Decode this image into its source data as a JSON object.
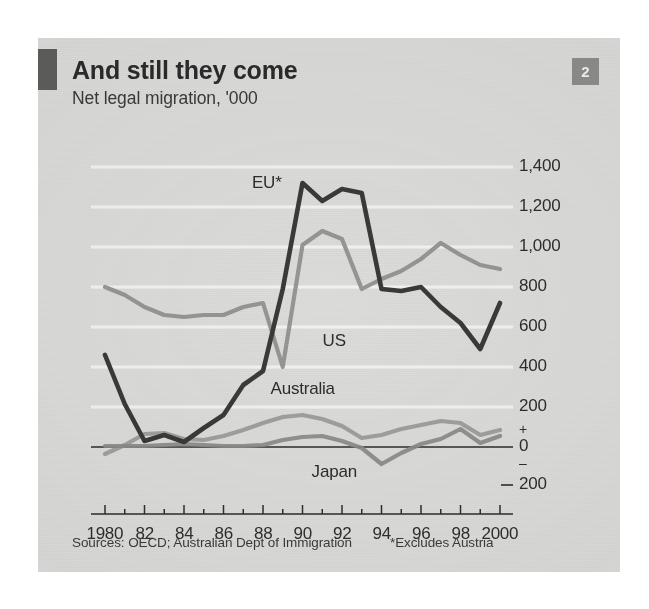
{
  "card": {
    "number_badge": "2",
    "title": "And still they come",
    "subtitle": "Net legal migration, '000",
    "source_note": "Sources: OECD; Australian Dept of Immigration",
    "footnote": "*Excludes Austria",
    "background_color": "#dcdcda",
    "rule_color": "#5e5e5c",
    "badge_color": "#8d8d8b"
  },
  "chart_data": {
    "type": "line",
    "title": "And still they come",
    "subtitle": "Net legal migration, '000",
    "xlabel": "",
    "ylabel": "Net legal migration, '000",
    "ylim": [
      -200,
      1500
    ],
    "xlim": [
      1980,
      2000
    ],
    "grid": true,
    "gridline_color": "#f4f4f2",
    "legend": "inline-labels",
    "y_ticks": [
      1400,
      1200,
      1000,
      800,
      600,
      400,
      200,
      0,
      -200
    ],
    "y_tick_labels": [
      "1,400",
      "1,200",
      "1,000",
      "800",
      "600",
      "400",
      "200",
      "0",
      "200"
    ],
    "y_sign_plus": "+",
    "y_sign_minus": "–",
    "x": [
      1980,
      1981,
      1982,
      1983,
      1984,
      1985,
      1986,
      1987,
      1988,
      1989,
      1990,
      1991,
      1992,
      1993,
      1994,
      1995,
      1996,
      1997,
      1998,
      1999,
      2000
    ],
    "x_tick_labels": [
      "1980",
      "82",
      "84",
      "86",
      "88",
      "90",
      "92",
      "94",
      "96",
      "98",
      "2000"
    ],
    "series": [
      {
        "name": "EU*",
        "label": "EU*",
        "color": "#3a3a38",
        "values": [
          460,
          215,
          30,
          60,
          25,
          95,
          160,
          310,
          380,
          790,
          1320,
          1230,
          1290,
          1270,
          790,
          780,
          800,
          700,
          620,
          490,
          720
        ]
      },
      {
        "name": "US",
        "label": "US",
        "color": "#8f8f8d",
        "values": [
          800,
          760,
          700,
          660,
          650,
          660,
          660,
          700,
          720,
          400,
          1010,
          1080,
          1040,
          790,
          840,
          880,
          940,
          1020,
          960,
          910,
          890
        ]
      },
      {
        "name": "Australia",
        "label": "Australia",
        "color": "#9a9a98",
        "values": [
          -35,
          10,
          65,
          70,
          40,
          35,
          55,
          85,
          120,
          150,
          160,
          140,
          105,
          45,
          60,
          90,
          110,
          130,
          120,
          60,
          85
        ]
      },
      {
        "name": "Japan",
        "label": "Japan",
        "color": "#8a8a88",
        "values": [
          5,
          5,
          5,
          10,
          15,
          10,
          5,
          5,
          10,
          35,
          50,
          55,
          30,
          -5,
          -85,
          -30,
          15,
          40,
          90,
          20,
          55
        ]
      }
    ],
    "annotations": [
      {
        "text": "EU*",
        "x": 1988.2,
        "y": 1320
      },
      {
        "text": "US",
        "x": 1991.6,
        "y": 530
      },
      {
        "text": "Australia",
        "x": 1990.0,
        "y": 290
      },
      {
        "text": "Japan",
        "x": 1991.6,
        "y": -125
      }
    ]
  }
}
